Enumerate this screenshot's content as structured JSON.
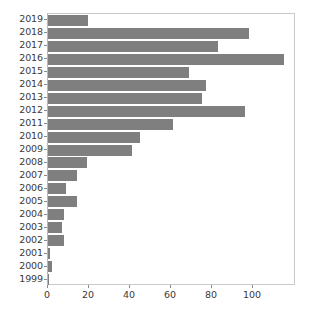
{
  "chart_data": {
    "type": "bar",
    "orientation": "horizontal",
    "title": "",
    "xlabel": "",
    "ylabel": "",
    "xlim": [
      0,
      121
    ],
    "xticks": [
      0,
      20,
      40,
      60,
      80,
      100
    ],
    "xtick_labels": [
      "0",
      "20",
      "40",
      "60",
      "80",
      "100"
    ],
    "grid": false,
    "legend": null,
    "bar_color": "#7f7f7f",
    "background_color": "#ffffff",
    "axes_edge_color": "#c9c9c9",
    "tick_label_color": "#3a3a3a",
    "categories": [
      "2019",
      "2018",
      "2017",
      "2016",
      "2015",
      "2014",
      "2013",
      "2012",
      "2011",
      "2010",
      "2009",
      "2008",
      "2007",
      "2006",
      "2005",
      "2004",
      "2003",
      "2002",
      "2001",
      "2000",
      "1999"
    ],
    "values": [
      19.5,
      98,
      83,
      115,
      69,
      77,
      75,
      96,
      61,
      45,
      41,
      19,
      14,
      9,
      14,
      8,
      7,
      8,
      1,
      2,
      0.5
    ]
  }
}
